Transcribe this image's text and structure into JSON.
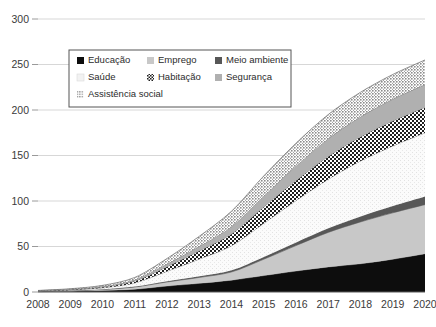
{
  "chart_data": {
    "type": "area",
    "title": "",
    "subtitle": "",
    "xlabel": "",
    "ylabel": "",
    "stacked": true,
    "grid": true,
    "legend_position": "top-left-inside",
    "xlim": [
      2008,
      2020
    ],
    "ylim": [
      0,
      300
    ],
    "yticks": [
      0,
      50,
      100,
      150,
      200,
      250,
      300
    ],
    "categories": [
      2008,
      2009,
      2010,
      2011,
      2012,
      2013,
      2014,
      2015,
      2016,
      2017,
      2018,
      2019,
      2020
    ],
    "xtick_labels": [
      "2008",
      "2009",
      "2010",
      "2011",
      "2012",
      "2013",
      "2014",
      "2015",
      "2016",
      "2017",
      "2018",
      "2019",
      "2020"
    ],
    "ytick_labels": [
      "0",
      "50",
      "100",
      "150",
      "200",
      "250",
      "300"
    ],
    "series": [
      {
        "name": "Educação",
        "pattern": "solid-black",
        "color": "#0d0d0d",
        "values": [
          0.4,
          0.8,
          1.6,
          3.0,
          6.5,
          9.5,
          13.0,
          18.0,
          23.0,
          27.5,
          31.0,
          36.0,
          42.0
        ]
      },
      {
        "name": "Emprego",
        "pattern": "solid-light-gray",
        "color": "#c8c8c8",
        "values": [
          0.3,
          0.6,
          1.2,
          2.5,
          4.5,
          6.5,
          9.0,
          18.0,
          28.0,
          38.0,
          46.0,
          51.0,
          54.0
        ]
      },
      {
        "name": "Meio ambiente",
        "pattern": "solid-dark-gray",
        "color": "#575757",
        "values": [
          0.1,
          0.2,
          0.3,
          0.5,
          0.8,
          1.2,
          1.8,
          2.5,
          3.5,
          4.5,
          6.0,
          7.5,
          9.0
        ]
      },
      {
        "name": "Saúde",
        "pattern": "very-light-speckle",
        "color": "#f4f4f4",
        "values": [
          0.3,
          0.7,
          1.5,
          4.0,
          11.0,
          19.0,
          27.0,
          37.0,
          46.0,
          54.0,
          61.0,
          66.0,
          70.0
        ]
      },
      {
        "name": "Habitação",
        "pattern": "checkerboard",
        "color": "#1f1f1f",
        "values": [
          0.2,
          0.4,
          0.9,
          2.0,
          5.0,
          9.0,
          13.0,
          18.0,
          22.0,
          25.0,
          26.5,
          27.5,
          28.0
        ]
      },
      {
        "name": "Segurança",
        "pattern": "solid-medium-gray",
        "color": "#b0b0b0",
        "values": [
          0.2,
          0.4,
          0.8,
          1.5,
          3.0,
          5.0,
          8.0,
          12.0,
          16.0,
          19.5,
          22.0,
          24.0,
          25.0
        ]
      },
      {
        "name": "Assistência social",
        "pattern": "coarse-speckle-gray",
        "color": "#9b9b9b",
        "values": [
          0.2,
          0.5,
          1.0,
          2.5,
          6.0,
          11.0,
          17.0,
          22.0,
          25.0,
          26.5,
          27.0,
          27.0,
          27.0
        ]
      }
    ],
    "totals": [
      1.7,
      3.6,
      7.3,
      16.0,
      36.8,
      61.2,
      88.8,
      127.5,
      163.5,
      195.0,
      219.5,
      239.0,
      255.0
    ]
  },
  "legend": {
    "items": [
      {
        "label": "Educação"
      },
      {
        "label": "Emprego"
      },
      {
        "label": "Meio ambiente"
      },
      {
        "label": "Saúde"
      },
      {
        "label": "Habitação"
      },
      {
        "label": "Segurança"
      },
      {
        "label": "Assistência social"
      }
    ]
  }
}
